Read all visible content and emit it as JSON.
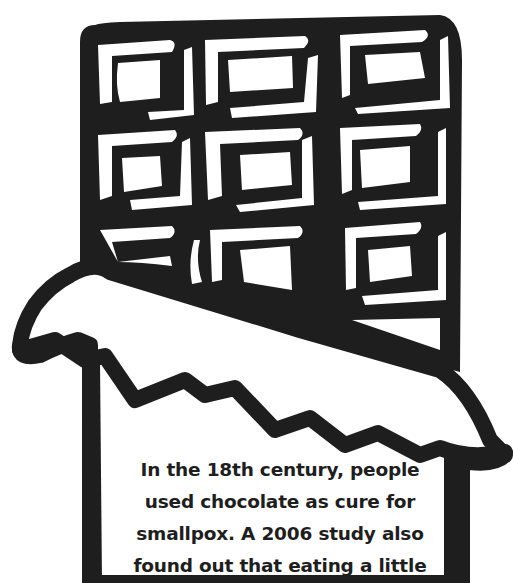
{
  "illustration": {
    "subject": "chocolate-bar-in-wrapper",
    "ink_color": "#1e1e1e",
    "background_color": "#ffffff",
    "grid": {
      "rows": 3,
      "columns": 3
    }
  },
  "caption": {
    "lines": [
      "In the 18th century, people",
      "used chocolate as cure for",
      "smallpox. A 2006 study also",
      "found out that eating a little"
    ]
  }
}
